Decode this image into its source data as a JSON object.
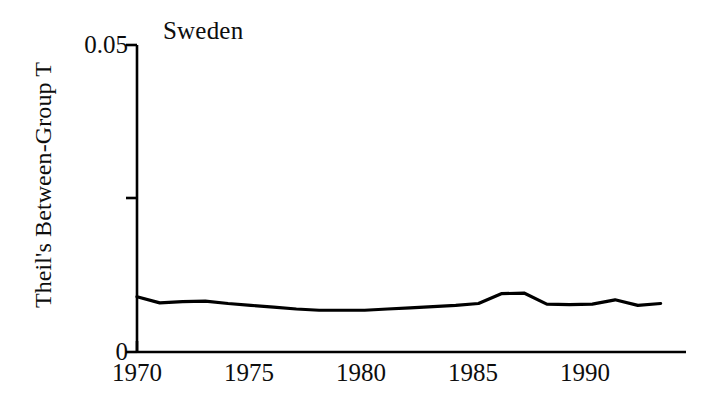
{
  "chart_data": {
    "type": "line",
    "title": "Sweden",
    "xlabel": "",
    "ylabel": "Theil's Between-Group T",
    "xlim": [
      1970,
      1993.5
    ],
    "ylim": [
      0,
      0.05
    ],
    "grid": false,
    "legend": null,
    "y_tick_labels": [
      "0",
      "0.05"
    ],
    "y_tick_values": [
      0,
      0.05
    ],
    "y_minor_tick_values": [
      0.025
    ],
    "x_tick_labels": [
      "1970",
      "1975",
      "1980",
      "1985",
      "1990"
    ],
    "x_tick_values": [
      1970,
      1975,
      1980,
      1985,
      1990
    ],
    "series": [
      {
        "name": "Theil's Between-Group T",
        "color": "#000000",
        "x": [
          1970,
          1971,
          1972,
          1973,
          1974,
          1975,
          1976,
          1977,
          1978,
          1979,
          1980,
          1981,
          1982,
          1983,
          1984,
          1985,
          1986,
          1987,
          1988,
          1989,
          1990,
          1991,
          1992,
          1993
        ],
        "values": [
          0.009,
          0.008,
          0.0082,
          0.0083,
          0.0079,
          0.0076,
          0.0073,
          0.007,
          0.0068,
          0.0068,
          0.0068,
          0.007,
          0.0072,
          0.0074,
          0.0076,
          0.0079,
          0.0095,
          0.0096,
          0.0078,
          0.0077,
          0.0078,
          0.0085,
          0.0076,
          0.0079
        ]
      }
    ]
  },
  "axis": {
    "y_top_label": "0.05",
    "y_bottom_label": "0",
    "y_axis_title": "Theil's Between-Group T",
    "x_labels": [
      "1970",
      "1975",
      "1980",
      "1985",
      "1990"
    ]
  },
  "title": {
    "text": "Sweden"
  }
}
